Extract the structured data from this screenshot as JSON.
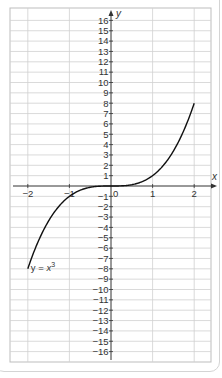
{
  "chart_data": {
    "type": "line",
    "title": "",
    "xlabel": "x",
    "ylabel": "y",
    "xlim": [
      -2,
      2
    ],
    "ylim": [
      -16,
      16
    ],
    "grid": true,
    "x_ticks": [
      -2,
      -1,
      0,
      1,
      2
    ],
    "y_ticks": [
      -16,
      -15,
      -14,
      -13,
      -12,
      -11,
      -10,
      -9,
      -8,
      -7,
      -6,
      -5,
      -4,
      -3,
      -2,
      -1,
      1,
      2,
      3,
      4,
      5,
      6,
      7,
      8,
      9,
      10,
      11,
      12,
      13,
      14,
      15,
      16
    ],
    "series": [
      {
        "name": "y = x^3",
        "label": "y = x³",
        "x": [
          -2,
          -1.5,
          -1,
          -0.5,
          0,
          0.5,
          1,
          1.5,
          2
        ],
        "y": [
          -8,
          -3.375,
          -1,
          -0.125,
          0,
          0.125,
          1,
          3.375,
          8
        ]
      }
    ],
    "annotations": [
      {
        "text": "y = x³",
        "x": -2,
        "y": -8
      }
    ]
  },
  "labels": {
    "x_axis": "x",
    "y_axis": "y",
    "origin": "0",
    "curve_label": "y = x",
    "curve_exp": "3"
  }
}
